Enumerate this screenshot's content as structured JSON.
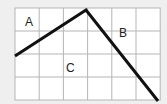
{
  "grid": {
    "x0": 15,
    "y0": 8,
    "cols": 6,
    "rows": 4,
    "cell_w": 24.2,
    "cell_h": 23,
    "line_color": "#b5b5b5",
    "fill": "#ffffff"
  },
  "polyline": {
    "points": [
      [
        15,
        56
      ],
      [
        86,
        10
      ],
      [
        158,
        101
      ]
    ],
    "color": "#111111",
    "width": 3
  },
  "regions": [
    {
      "label": "A",
      "x": 25,
      "y": 16
    },
    {
      "label": "B",
      "x": 119,
      "y": 27
    },
    {
      "label": "C",
      "x": 66,
      "y": 62
    }
  ]
}
